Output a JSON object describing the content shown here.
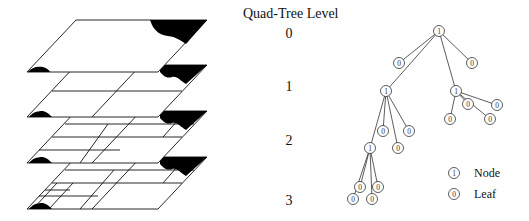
{
  "title": "Quad-Tree Level",
  "levels": [
    {
      "label": "0",
      "x": 279,
      "y": 23
    },
    {
      "label": "1",
      "x": 279,
      "y": 77
    },
    {
      "label": "2",
      "x": 279,
      "y": 130
    },
    {
      "label": "3",
      "x": 279,
      "y": 191
    }
  ],
  "legend": {
    "node": {
      "symbol": "1",
      "label": "Node"
    },
    "leaf": {
      "symbol": "0",
      "label": "Leaf"
    }
  },
  "colors": {
    "ink": "#111111",
    "fill": "#ffffff",
    "region": "#000000"
  },
  "tree": {
    "nodes": [
      {
        "id": "root",
        "type": "node",
        "x": 439,
        "y": 31,
        "label": "1"
      },
      {
        "id": "a",
        "type": "leaf",
        "x": 399,
        "y": 63,
        "label": "0"
      },
      {
        "id": "b",
        "type": "leaf",
        "x": 472,
        "y": 63,
        "label": "0"
      },
      {
        "id": "c",
        "type": "node",
        "x": 386,
        "y": 91,
        "label": "1"
      },
      {
        "id": "d",
        "type": "node",
        "x": 456,
        "y": 91,
        "label": "1"
      },
      {
        "id": "d1",
        "type": "leaf",
        "x": 468,
        "y": 104,
        "label": "0"
      },
      {
        "id": "d2",
        "type": "leaf",
        "x": 497,
        "y": 105,
        "label": "0"
      },
      {
        "id": "d3",
        "type": "leaf",
        "x": 450,
        "y": 119,
        "label": "0"
      },
      {
        "id": "d4",
        "type": "leaf",
        "x": 490,
        "y": 119,
        "label": "0"
      },
      {
        "id": "c1",
        "type": "leaf",
        "x": 383,
        "y": 131,
        "label": "0"
      },
      {
        "id": "c2",
        "type": "leaf",
        "x": 409,
        "y": 131,
        "label": "0"
      },
      {
        "id": "c3",
        "type": "leaf",
        "x": 398,
        "y": 148,
        "label": "0"
      },
      {
        "id": "c4",
        "type": "node",
        "x": 370,
        "y": 148,
        "label": "1"
      },
      {
        "id": "e1",
        "type": "leaf",
        "x": 360,
        "y": 187,
        "label": "0"
      },
      {
        "id": "e2",
        "type": "leaf",
        "x": 378,
        "y": 187,
        "label": "0"
      },
      {
        "id": "e3",
        "type": "leaf",
        "x": 353,
        "y": 199,
        "label": "0"
      },
      {
        "id": "e4",
        "type": "leaf",
        "x": 372,
        "y": 199,
        "label": "0"
      }
    ],
    "edges": [
      [
        "root",
        "a"
      ],
      [
        "root",
        "b"
      ],
      [
        "root",
        "c"
      ],
      [
        "root",
        "d"
      ],
      [
        "d",
        "d1"
      ],
      [
        "d",
        "d2"
      ],
      [
        "d",
        "d3"
      ],
      [
        "d",
        "d4"
      ],
      [
        "c",
        "c1"
      ],
      [
        "c",
        "c2"
      ],
      [
        "c",
        "c3"
      ],
      [
        "c",
        "c4"
      ],
      [
        "c4",
        "e1"
      ],
      [
        "c4",
        "e2"
      ],
      [
        "c4",
        "e3"
      ],
      [
        "c4",
        "e4"
      ]
    ]
  },
  "legend_items": [
    {
      "type": "node",
      "x": 454,
      "y": 173,
      "label": "Node",
      "symbol": "1"
    },
    {
      "type": "leaf",
      "x": 454,
      "y": 194,
      "label": "Leaf",
      "symbol": "0"
    }
  ]
}
